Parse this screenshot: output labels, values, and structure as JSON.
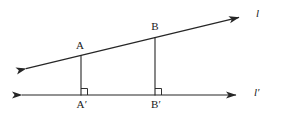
{
  "figure": {
    "stroke_color": "#262626",
    "background_color": "#ffffff",
    "labels": {
      "point_a": "A",
      "point_b": "B",
      "foot_a": "A′",
      "foot_b": "B′",
      "line_l": "l",
      "line_l_prime": "l′"
    },
    "geometry": {
      "line_l": {
        "name": "l",
        "x1": 16,
        "y1": 71,
        "x2": 248,
        "y2": 15,
        "arrow_start": true,
        "arrow_end": true
      },
      "line_l_prime": {
        "name": "l′",
        "x1": 12,
        "y1": 95,
        "x2": 245,
        "y2": 95,
        "arrow_start": true,
        "arrow_end": true
      },
      "segment_aa_prime": {
        "name": "AA′",
        "x1": 81,
        "y1": 55,
        "x2": 81,
        "y2": 95,
        "perpendicular": true
      },
      "segment_bb_prime": {
        "name": "BB′",
        "x1": 155,
        "y1": 37,
        "x2": 155,
        "y2": 95,
        "perpendicular": true
      },
      "points": [
        {
          "id": "A",
          "x": 81,
          "y": 55
        },
        {
          "id": "B",
          "x": 155,
          "y": 37
        },
        {
          "id": "A'",
          "x": 81,
          "y": 95
        },
        {
          "id": "B'",
          "x": 155,
          "y": 95
        }
      ],
      "right_angle_marks": [
        {
          "at": "A'",
          "x": 81,
          "y": 95,
          "size": 7
        },
        {
          "at": "B'",
          "x": 155,
          "y": 95,
          "size": 7
        }
      ]
    },
    "label_positions": {
      "point_a": {
        "x": 80,
        "y": 40
      },
      "point_b": {
        "x": 155,
        "y": 21
      },
      "foot_a": {
        "x": 82,
        "y": 99
      },
      "foot_b": {
        "x": 156,
        "y": 99
      },
      "line_l": {
        "x": 256,
        "y": 8
      },
      "line_l_prime": {
        "x": 254,
        "y": 87
      }
    }
  }
}
